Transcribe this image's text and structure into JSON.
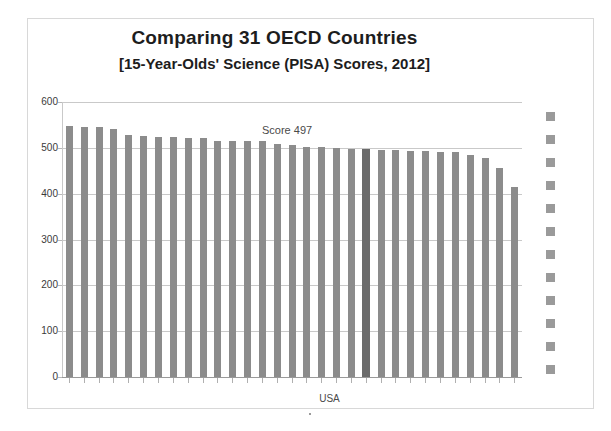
{
  "chart_data": {
    "type": "bar",
    "title": "Comparing 31 OECD Countries",
    "subtitle": "[15-Year-Olds' Science (PISA) Scores, 2012]",
    "xlabel": "",
    "ylabel": "",
    "ylim": [
      0,
      600
    ],
    "ytick_labels": [
      "600",
      "500",
      "400",
      "300",
      "200",
      "100",
      "0"
    ],
    "ytick_values": [
      600,
      500,
      400,
      300,
      200,
      100,
      0
    ],
    "grid": true,
    "legend_position": "right",
    "categories": [
      "1",
      "2",
      "3",
      "4",
      "5",
      "6",
      "7",
      "8",
      "9",
      "10",
      "11",
      "12",
      "13",
      "14",
      "15",
      "16",
      "17",
      "18",
      "19",
      "20",
      "USA",
      "22",
      "23",
      "24",
      "25",
      "26",
      "27",
      "28",
      "29",
      "30",
      "31"
    ],
    "values": [
      548,
      545,
      545,
      541,
      528,
      525,
      524,
      524,
      522,
      522,
      516,
      515,
      514,
      514,
      508,
      506,
      502,
      502,
      499,
      498,
      497,
      496,
      495,
      494,
      494,
      491,
      491,
      485,
      478,
      455,
      415
    ],
    "highlight_index": 20,
    "highlight_label": "USA",
    "annotation": "Score 497",
    "annotation_value": 497,
    "bar_color": "#8c8c8c",
    "highlight_color": "#6b6b6b",
    "grid_color": "#c9c9c9",
    "legend_swatch_color": "#9a9a9a",
    "legend_swatch_count": 12
  },
  "axis_labels": {
    "usa": "USA"
  }
}
